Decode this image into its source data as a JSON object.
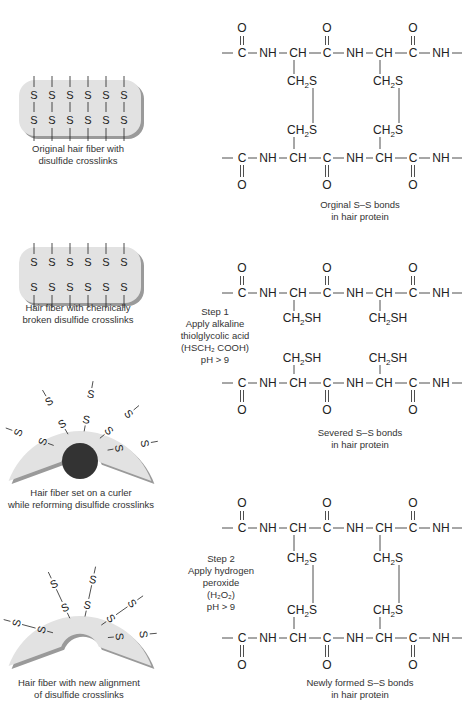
{
  "panels": [
    {
      "id": "original",
      "fiber_caption": [
        "Original hair fiber with",
        "disulfide crosslinks"
      ],
      "chem_caption": [
        "Orginal S–S bonds",
        "in hair protein"
      ],
      "side_groups_top": [
        "CH2S",
        "CH2S"
      ],
      "side_groups_bottom": [
        "CH2S",
        "CH2S"
      ],
      "bonded": true
    },
    {
      "id": "broken",
      "fiber_caption": [
        "Hair fiber with chemically",
        "broken disulfide crosslinks"
      ],
      "step": [
        "Step 1",
        "Apply alkaline",
        "thiolglycolic acid",
        "(HSCH₂ COOH)",
        "pH > 9"
      ],
      "chem_caption": [
        "Severed S–S bonds",
        "in hair protein"
      ],
      "side_groups_top": [
        "CH2SH",
        "CH2SH"
      ],
      "side_groups_bottom": [
        "CH2SH",
        "CH2SH"
      ],
      "bonded": false
    },
    {
      "id": "curler",
      "fiber_caption": [
        "Hair fiber set on a curler",
        "while reforming disulfide crosslinks"
      ]
    },
    {
      "id": "reformed",
      "fiber_caption": [
        "Hair fiber with new alignment",
        "of disulfide crosslinks"
      ],
      "step": [
        "Step 2",
        "Apply hydrogen",
        "peroxide",
        "(H₂O₂)",
        "pH > 9"
      ],
      "chem_caption": [
        "Newly formed S–S bonds",
        "in hair protein"
      ],
      "side_groups_top": [
        "CH2S",
        "CH2S"
      ],
      "side_groups_bottom": [
        "CH2S",
        "CH2S"
      ],
      "bonded": true
    }
  ],
  "backbone": {
    "atoms": [
      "C",
      "NH",
      "CH",
      "C",
      "NH",
      "CH",
      "C",
      "NH"
    ],
    "carbonyl": "O",
    "sulfur": "S"
  },
  "colors": {
    "fiber_fill": "#e2e2e2",
    "fiber_shadow": "#9a9a9a",
    "curler": "#333333",
    "ink": "#222222"
  }
}
